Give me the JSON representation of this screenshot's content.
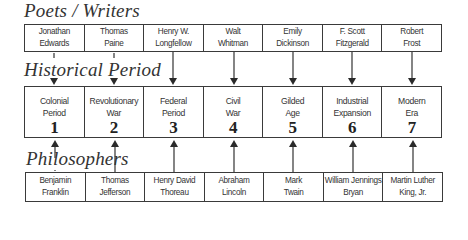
{
  "sections": {
    "poets_title": "Poets / Writers",
    "historical_title": "Historical Period",
    "philosophers_title": "Philosophers"
  },
  "poets": [
    {
      "line1": "Jonathan",
      "line2": "Edwards"
    },
    {
      "line1": "Thomas",
      "line2": "Paine"
    },
    {
      "line1": "Henry W.",
      "line2": "Longfellow"
    },
    {
      "line1": "Walt",
      "line2": "Whitman"
    },
    {
      "line1": "Emily",
      "line2": "Dickinson"
    },
    {
      "line1": "F. Scott",
      "line2": "Fitzgerald"
    },
    {
      "line1": "Robert",
      "line2": "Frost"
    }
  ],
  "periods": [
    {
      "line1": "Colonial",
      "line2": "Period",
      "number": "1"
    },
    {
      "line1": "Revolutionary",
      "line2": "War",
      "number": "2"
    },
    {
      "line1": "Federal",
      "line2": "Period",
      "number": "3"
    },
    {
      "line1": "Civil",
      "line2": "War",
      "number": "4"
    },
    {
      "line1": "Gilded",
      "line2": "Age",
      "number": "5"
    },
    {
      "line1": "Industrial",
      "line2": "Expansion",
      "number": "6"
    },
    {
      "line1": "Modern",
      "line2": "Era",
      "number": "7"
    }
  ],
  "philosophers": [
    {
      "line1": "Benjamin",
      "line2": "Franklin"
    },
    {
      "line1": "Thomas",
      "line2": "Jefferson"
    },
    {
      "line1": "Henry David",
      "line2": "Thoreau"
    },
    {
      "line1": "Abraham",
      "line2": "Lincoln"
    },
    {
      "line1": "Mark",
      "line2": "Twain"
    },
    {
      "line1": "William Jennings",
      "line2": "Bryan"
    },
    {
      "line1": "Martin Luther",
      "line2": "King, Jr."
    }
  ],
  "colors": {
    "line": "#3a3a3a",
    "text": "#333333",
    "background": "#ffffff"
  }
}
